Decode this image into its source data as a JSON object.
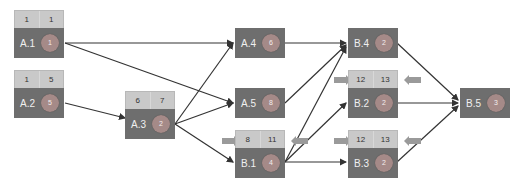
{
  "nodes": {
    "A1": {
      "label": "A.1",
      "duration": "1",
      "es": "1",
      "ef": "1"
    },
    "A2": {
      "label": "A.2",
      "duration": "5",
      "es": "1",
      "ef": "5"
    },
    "A3": {
      "label": "A.3",
      "duration": "2",
      "es": "6",
      "ef": "7"
    },
    "A4": {
      "label": "A.4",
      "duration": "6"
    },
    "A5": {
      "label": "A.5",
      "duration": "8"
    },
    "B1": {
      "label": "B.1",
      "duration": "4",
      "es": "8",
      "ef": "11"
    },
    "B4": {
      "label": "B.4",
      "duration": "2"
    },
    "B2": {
      "label": "B.2",
      "duration": "2",
      "es": "12",
      "ef": "13"
    },
    "B3": {
      "label": "B.3",
      "duration": "2",
      "es": "12",
      "ef": "13"
    },
    "B5": {
      "label": "B.5",
      "duration": "3"
    }
  },
  "edges": [
    [
      "A.1",
      "A.4"
    ],
    [
      "A.1",
      "A.5"
    ],
    [
      "A.2",
      "A.3"
    ],
    [
      "A.3",
      "A.4"
    ],
    [
      "A.3",
      "A.5"
    ],
    [
      "A.3",
      "B.1"
    ],
    [
      "A.4",
      "B.4"
    ],
    [
      "A.5",
      "B.4"
    ],
    [
      "B.1",
      "B.4"
    ],
    [
      "B.1",
      "B.2"
    ],
    [
      "B.1",
      "B.3"
    ],
    [
      "B.4",
      "B.5"
    ],
    [
      "B.2",
      "B.5"
    ],
    [
      "B.3",
      "B.5"
    ]
  ],
  "colors": {
    "node_body": "#6e6e6e",
    "node_top": "#c9c9c9",
    "circle": "#a58a88",
    "edge": "#333333"
  }
}
